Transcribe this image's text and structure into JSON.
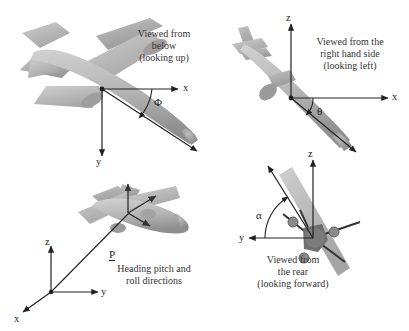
{
  "figure": {
    "background": "#ffffff",
    "aircraft_fill_light": "#c9c9c9",
    "aircraft_fill_mid": "#b0b0b0",
    "aircraft_fill_dark": "#8f8f8f",
    "axis_color": "#222222"
  },
  "panels": {
    "top_left": {
      "caption_line1": "Viewed from",
      "caption_line2": "below",
      "caption_line3": "(looking up)",
      "axis_x_label": "x",
      "axis_y_label": "y",
      "angle_label": "Φ",
      "angle_name": "heading"
    },
    "top_right": {
      "caption_line1": "Viewed from the",
      "caption_line2": "right hand side",
      "caption_line3": "(looking left)",
      "axis_x_label": "x",
      "axis_z_label": "z",
      "angle_label": "θ",
      "angle_name": "pitch"
    },
    "bottom_left": {
      "caption_line1": "Heading pitch and",
      "caption_line2": "roll directions",
      "axis_x_label": "x",
      "axis_y_label": "y",
      "axis_z_label": "z",
      "vector_label": "P"
    },
    "bottom_right": {
      "caption_line1": "Viewed from",
      "caption_line2": "the rear",
      "caption_line3": "(looking forward)",
      "axis_y_label": "y",
      "axis_z_label": "z",
      "angle_label": "α",
      "angle_name": "roll"
    }
  }
}
